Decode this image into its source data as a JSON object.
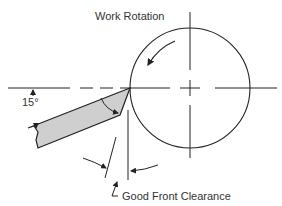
{
  "diagram": {
    "title": "Work Rotation",
    "angle_label": "15°",
    "clearance_label": "Good Front Clearance",
    "colors": {
      "line": "#222222",
      "tool_fill": "#cfcfcf",
      "text": "#333333"
    }
  }
}
